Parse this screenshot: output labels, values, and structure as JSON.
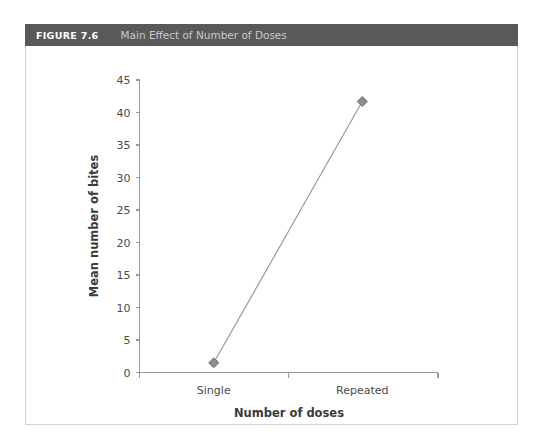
{
  "figure": {
    "number_label": "FIGURE 7.6",
    "caption": "Main Effect of Number of Doses"
  },
  "colors": {
    "header_background": "#595959",
    "header_number_text": "#ffffff",
    "header_caption_text": "#c9c9c9",
    "panel_border": "#d2d2d2",
    "axis": "#9a9a9a",
    "marker_fill": "#8d8d8d",
    "marker_stroke": "#6e6e6e",
    "series_line": "#9b9b9b",
    "tick_text": "#4a4a4a",
    "axis_title_text": "#3a3a3a"
  },
  "chart_data": {
    "type": "line",
    "title": "Main Effect of Number of Doses",
    "xlabel": "Number of doses",
    "ylabel": "Mean number of bites",
    "categories": [
      "Single",
      "Repeated"
    ],
    "values": [
      1.5,
      41.7
    ],
    "series": [
      {
        "name": "Mean number of bites",
        "values": [
          1.5,
          41.7
        ]
      }
    ],
    "ylim": [
      0,
      45
    ],
    "ytick_step": 5,
    "yticks": [
      0,
      5,
      10,
      15,
      20,
      25,
      30,
      35,
      40,
      45
    ],
    "ytick_labels": [
      "0",
      "5",
      "10",
      "15",
      "20",
      "25",
      "30",
      "35",
      "40",
      "45"
    ],
    "xtick_labels": [
      "Single",
      "Repeated"
    ],
    "grid": false,
    "legend": false,
    "legend_position": "none",
    "marker": "diamond"
  }
}
